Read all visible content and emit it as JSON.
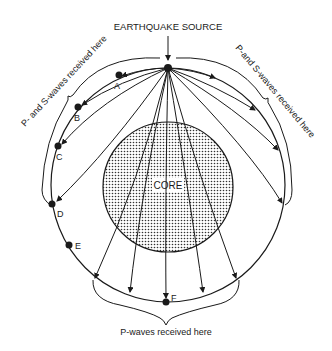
{
  "title": "EARTHQUAKE SOURCE",
  "core_label": "CORE",
  "stations": [
    {
      "id": "A",
      "label": "A"
    },
    {
      "id": "B",
      "label": "B"
    },
    {
      "id": "C",
      "label": "C"
    },
    {
      "id": "D",
      "label": "D"
    },
    {
      "id": "E",
      "label": "E"
    },
    {
      "id": "F",
      "label": "F"
    }
  ],
  "brace_labels": {
    "left": "P- and S-waves received here",
    "right": "P-and S-waves received here",
    "bottom": "P-waves received here"
  },
  "colors": {
    "ink": "#1a1a1a",
    "background": "#ffffff",
    "core_fill": "#e6e6e6"
  }
}
